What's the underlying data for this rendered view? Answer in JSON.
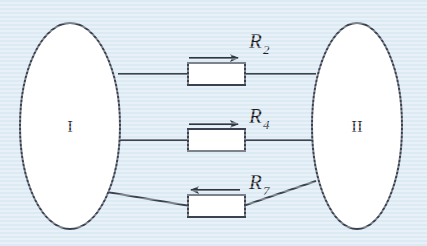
{
  "figure": {
    "name": "two-terminal-network-with-three-resistor-branches",
    "background_color": "#dceaf4",
    "line_color": "#3c4450",
    "box_fill": "#ffffff",
    "text_color": "#1d1d26"
  },
  "nodes": [
    {
      "id": "node-1",
      "label": "I",
      "cx": 70,
      "cy": 126,
      "rx": 50,
      "ry": 103
    },
    {
      "id": "node-2",
      "label": "II",
      "cx": 357,
      "cy": 126,
      "rx": 45,
      "ry": 103
    }
  ],
  "branches": [
    {
      "id": "branch-r2",
      "label": "R",
      "subscript": "2",
      "arrow_direction": "right",
      "box": {
        "x": 188,
        "y": 63,
        "w": 57,
        "h": 22
      },
      "wire_y_left": 74,
      "wire_y_right": 74,
      "arrow": {
        "x1": 189,
        "x2": 240,
        "y": 58
      },
      "label_pos": {
        "x": 249,
        "y": 47
      }
    },
    {
      "id": "branch-r4",
      "label": "R",
      "subscript": "4",
      "arrow_direction": "right",
      "box": {
        "x": 188,
        "y": 129,
        "w": 57,
        "h": 22
      },
      "wire_y_left": 140,
      "wire_y_right": 140,
      "arrow": {
        "x1": 189,
        "x2": 240,
        "y": 124
      },
      "label_pos": {
        "x": 249,
        "y": 122
      }
    },
    {
      "id": "branch-r7",
      "label": "R",
      "subscript": "7",
      "arrow_direction": "left",
      "box": {
        "x": 188,
        "y": 195,
        "w": 57,
        "h": 22
      },
      "wire_y_left": 193,
      "wire_y_right": 182,
      "arrow": {
        "x1": 240,
        "x2": 189,
        "y": 190
      },
      "label_pos": {
        "x": 249,
        "y": 188
      }
    }
  ],
  "icons": {
    "arrow_right": "arrow-right-icon",
    "arrow_left": "arrow-left-icon"
  }
}
